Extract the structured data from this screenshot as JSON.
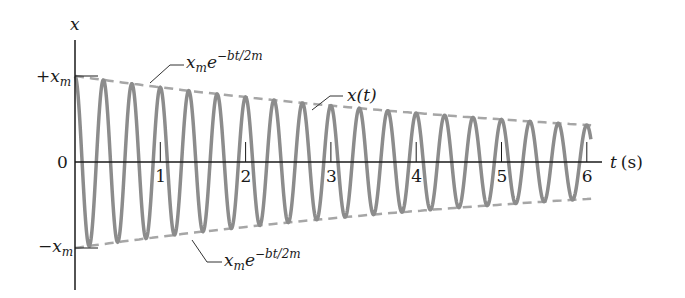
{
  "chart_data": {
    "type": "line",
    "xlabel": "t (s)",
    "ylabel": "x",
    "xlim": [
      0,
      6.3
    ],
    "ylim": [
      -1,
      1
    ],
    "x_ticks": [
      1,
      2,
      3,
      4,
      5,
      6
    ],
    "y_tick_labels": [
      "+x_m",
      "0",
      "-x_m"
    ],
    "grid": false,
    "series": [
      {
        "name": "x(t)",
        "style": "solid-gray",
        "formula": "x_m * exp(-b t / 2m) * cos(omega t)",
        "amplitude_start": 1.0,
        "amplitude_at_6s": 0.43,
        "frequency_hz": 3.0,
        "t_end": 6.05
      },
      {
        "name": "+x_m e^{-bt/2m}",
        "style": "dashed-gray",
        "role": "upper envelope"
      },
      {
        "name": "-x_m e^{-bt/2m}",
        "style": "dashed-gray",
        "role": "lower envelope"
      }
    ],
    "annotations": [
      {
        "text": "x_m e^{-bt/2m}",
        "target": "upper envelope"
      },
      {
        "text": "x(t)",
        "target": "oscillation curve"
      },
      {
        "text": "x_m e^{-bt/2m}",
        "target": "lower envelope"
      }
    ]
  },
  "labels": {
    "y_axis": "x",
    "x_axis_var": "t",
    "x_axis_unit": "(s)",
    "plus_xm_sign": "+",
    "minus_xm_sign": "−",
    "xm_base": "x",
    "xm_sub": "m",
    "zero": "0",
    "envelope_exp": "−bt/2m",
    "curve_label": "x(t)"
  },
  "colors": {
    "axis": "#1a1a1a",
    "curve": "#8c8c8c",
    "envelope": "#a6a6a6",
    "leader": "#333333"
  }
}
